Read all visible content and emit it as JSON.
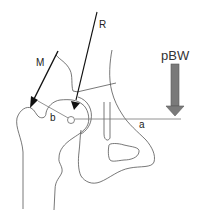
{
  "diagram": {
    "type": "hip biomechanics free-body diagram",
    "labels": {
      "muscle_force": "M",
      "joint_reaction": "R",
      "body_weight": "pBW",
      "lever_arm_muscle": "b",
      "lever_arm_weight": "a"
    },
    "colors": {
      "outline": "#555555",
      "force_arrow": "#111111",
      "weight_arrow": "#7a7a7a",
      "weight_arrow_edge": "#5a5a5a",
      "background": "#ffffff"
    }
  }
}
